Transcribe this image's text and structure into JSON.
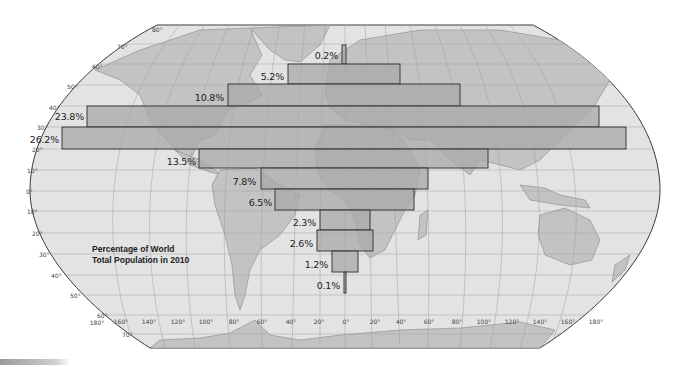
{
  "map": {
    "title_line1": "Percentage of World",
    "title_line2": "Total Population in 2010",
    "projection": "Robinson-style world map",
    "colors": {
      "ocean": "#e3e3e3",
      "land": "#c3c3c3",
      "bar_fill": "#a8a8a8",
      "bar_stroke": "#3a3a3a",
      "grid": "#9a9a9a",
      "outline": "#3a3a3a"
    },
    "lat_labels": [
      {
        "text": "80°",
        "x": 152,
        "y": 29
      },
      {
        "text": "70°",
        "x": 117,
        "y": 46
      },
      {
        "text": "60°",
        "x": 92,
        "y": 66
      },
      {
        "text": "50°",
        "x": 67,
        "y": 86
      },
      {
        "text": "40°",
        "x": 49,
        "y": 107
      },
      {
        "text": "30°",
        "x": 37,
        "y": 127
      },
      {
        "text": "20°",
        "x": 32,
        "y": 149
      },
      {
        "text": "10°",
        "x": 27,
        "y": 170
      },
      {
        "text": "0°",
        "x": 26,
        "y": 191
      },
      {
        "text": "10°",
        "x": 27,
        "y": 211
      },
      {
        "text": "20°",
        "x": 32,
        "y": 233
      },
      {
        "text": "30°",
        "x": 39,
        "y": 254
      },
      {
        "text": "40°",
        "x": 51,
        "y": 275
      },
      {
        "text": "50°",
        "x": 70,
        "y": 295
      },
      {
        "text": "60°",
        "x": 97,
        "y": 315
      },
      {
        "text": "70°",
        "x": 122,
        "y": 334
      }
    ],
    "lon_labels": [
      {
        "text": "180°",
        "x": 97,
        "y": 322
      },
      {
        "text": "160°",
        "x": 121,
        "y": 321
      },
      {
        "text": "140°",
        "x": 149,
        "y": 321
      },
      {
        "text": "120°",
        "x": 178,
        "y": 321
      },
      {
        "text": "100°",
        "x": 206,
        "y": 321
      },
      {
        "text": "80°",
        "x": 234,
        "y": 321
      },
      {
        "text": "60°",
        "x": 262,
        "y": 321
      },
      {
        "text": "40°",
        "x": 291,
        "y": 321
      },
      {
        "text": "20°",
        "x": 319,
        "y": 321
      },
      {
        "text": "0°",
        "x": 346,
        "y": 321
      },
      {
        "text": "20°",
        "x": 375,
        "y": 321
      },
      {
        "text": "40°",
        "x": 401,
        "y": 321
      },
      {
        "text": "60°",
        "x": 429,
        "y": 321
      },
      {
        "text": "80°",
        "x": 457,
        "y": 321
      },
      {
        "text": "100°",
        "x": 484,
        "y": 321
      },
      {
        "text": "120°",
        "x": 512,
        "y": 321
      },
      {
        "text": "140°",
        "x": 540,
        "y": 321
      },
      {
        "text": "160°",
        "x": 568,
        "y": 321
      },
      {
        "text": "180°",
        "x": 596,
        "y": 321
      }
    ]
  },
  "chart_data": {
    "type": "bar",
    "orientation": "horizontal",
    "title": "Percentage of World Total Population in 2010",
    "xlabel": "",
    "ylabel": "Latitude band",
    "categories": [
      "70°N–80°N",
      "60°N–70°N",
      "50°N–60°N",
      "40°N–50°N",
      "30°N–40°N",
      "20°N–30°N",
      "10°N–20°N",
      "0°–10°N",
      "0°–10°S",
      "10°S–20°S",
      "20°S–30°S",
      "30°S–40°S"
    ],
    "values": [
      0.2,
      5.2,
      10.8,
      23.8,
      26.2,
      13.5,
      7.8,
      6.5,
      2.3,
      2.6,
      1.2,
      0.1
    ],
    "labels": [
      "0.2%",
      "5.2%",
      "10.8%",
      "23.8%",
      "26.2%",
      "13.5%",
      "7.8%",
      "6.5%",
      "2.3%",
      "2.6%",
      "1.2%",
      "0.1%"
    ],
    "bars_px": [
      {
        "x1": 342,
        "x2": 346,
        "y1": 45,
        "y2": 64
      },
      {
        "x1": 288,
        "x2": 400,
        "y1": 64,
        "y2": 84
      },
      {
        "x1": 228,
        "x2": 460,
        "y1": 84,
        "y2": 106
      },
      {
        "x1": 87,
        "x2": 599,
        "y1": 106,
        "y2": 127
      },
      {
        "x1": 62,
        "x2": 626,
        "y1": 127,
        "y2": 149
      },
      {
        "x1": 199,
        "x2": 488,
        "y1": 149,
        "y2": 168
      },
      {
        "x1": 261,
        "x2": 428,
        "y1": 168,
        "y2": 189
      },
      {
        "x1": 275,
        "x2": 414,
        "y1": 189,
        "y2": 210
      },
      {
        "x1": 320,
        "x2": 370,
        "y1": 210,
        "y2": 230
      },
      {
        "x1": 317,
        "x2": 373,
        "y1": 230,
        "y2": 251
      },
      {
        "x1": 332,
        "x2": 358,
        "y1": 251,
        "y2": 272
      },
      {
        "x1": 344,
        "x2": 346,
        "y1": 272,
        "y2": 293
      }
    ],
    "label_px": [
      {
        "x": 338,
        "y": 55
      },
      {
        "x": 284,
        "y": 76
      },
      {
        "x": 224,
        "y": 97
      },
      {
        "x": 84,
        "y": 116
      },
      {
        "x": 59,
        "y": 139
      },
      {
        "x": 196,
        "y": 161
      },
      {
        "x": 256,
        "y": 181
      },
      {
        "x": 272,
        "y": 202
      },
      {
        "x": 316,
        "y": 222
      },
      {
        "x": 313,
        "y": 243
      },
      {
        "x": 328,
        "y": 264
      },
      {
        "x": 340,
        "y": 285
      }
    ],
    "grid": true,
    "legend": "none"
  }
}
